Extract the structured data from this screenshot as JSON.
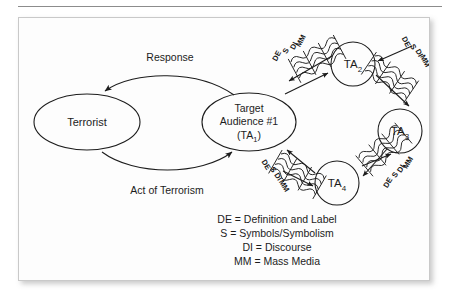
{
  "figure": {
    "background_color": "#ffffff",
    "panel_color": "#fdfdfd",
    "ink_color": "#1c1c1c",
    "border_color": "#c9c9c9"
  },
  "nodes": {
    "terrorist": {
      "label": "Terrorist",
      "shape": "ellipse"
    },
    "target_audience_1": {
      "line1": "Target",
      "line2": "Audience #1",
      "line3_prefix": "(TA",
      "line3_sub": "1",
      "line3_suffix": ")",
      "shape": "ellipse"
    },
    "ta2": {
      "label_prefix": "TA",
      "label_sub": "2",
      "shape": "circle"
    },
    "ta3": {
      "label_prefix": "TA",
      "label_sub": "3",
      "shape": "circle"
    },
    "ta4": {
      "label_prefix": "TA",
      "label_sub": "4",
      "shape": "circle"
    }
  },
  "flows": {
    "response": "Response",
    "act_of_terrorism": "Act of Terrorism"
  },
  "channel_labels": {
    "de": "DE",
    "s": "S",
    "di": "DI",
    "mm": "MM"
  },
  "channel_bundles": [
    {
      "name": "ta1-to-ta2",
      "labels": [
        "MM",
        "DI",
        "S",
        "DE"
      ]
    },
    {
      "name": "ta2-to-ta3",
      "labels": [
        "DE",
        "S",
        "DI",
        "MM"
      ]
    },
    {
      "name": "ta1-to-ta4",
      "labels": [
        "DE",
        "S",
        "DI",
        "MM"
      ]
    },
    {
      "name": "ta4-to-ta3",
      "labels": [
        "MM",
        "DI",
        "S",
        "DE"
      ]
    }
  ],
  "legend": {
    "items": [
      "DE = Definition and Label",
      "S = Symbols/Symbolism",
      "DI = Discourse",
      "MM = Mass Media"
    ]
  }
}
